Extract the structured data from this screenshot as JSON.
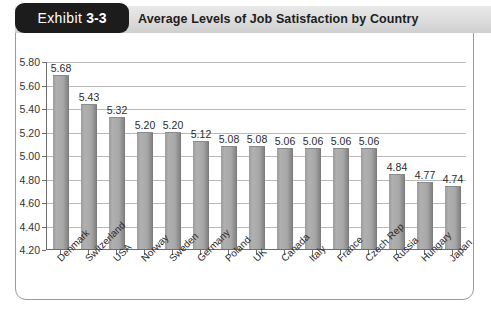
{
  "exhibit": {
    "badge_word": "Exhibit",
    "badge_number": "3-3",
    "title": "Average Levels of Job Satisfaction by Country"
  },
  "colors": {
    "badge_background": "#1c1c1c",
    "header_band": "#dcdcdc",
    "bar_fill": "#a8a8a8",
    "gridline": "#b9b9b9",
    "axis": "#6d6d6d",
    "card_border": "#9a9a9a"
  },
  "chart_data": {
    "type": "bar",
    "title": "Average Levels of Job Satisfaction by Country",
    "xlabel": "",
    "ylabel": "",
    "ylim": [
      4.2,
      5.8
    ],
    "ytick_step": 0.2,
    "yticks": [
      "5.80",
      "5.60",
      "5.40",
      "5.20",
      "5.00",
      "4.80",
      "4.60",
      "4.40",
      "4.20"
    ],
    "grid": true,
    "legend": false,
    "categories": [
      "Denmark",
      "Switzerland",
      "USA",
      "Norway",
      "Sweden",
      "Germany",
      "Poland",
      "UK",
      "Canada",
      "Italy",
      "France",
      "Czech Rep",
      "Russia",
      "Hungary",
      "Japan"
    ],
    "values": [
      5.68,
      5.43,
      5.32,
      5.2,
      5.2,
      5.12,
      5.08,
      5.08,
      5.06,
      5.06,
      5.06,
      5.06,
      4.84,
      4.77,
      4.74
    ],
    "value_labels": [
      "5.68",
      "5.43",
      "5.32",
      "5.20",
      "5.20",
      "5.12",
      "5.08",
      "5.08",
      "5.06",
      "5.06",
      "5.06",
      "5.06",
      "4.84",
      "4.77",
      "4.74"
    ]
  }
}
